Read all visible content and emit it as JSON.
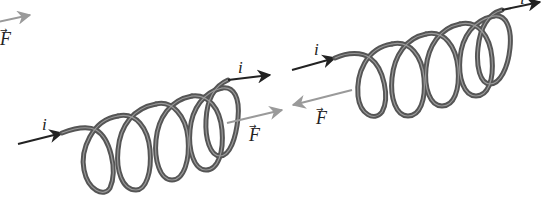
{
  "diagram": {
    "colors": {
      "coil": "#5a5a5a",
      "coil_highlight": "#9a9a9a",
      "current_arrow": "#222222",
      "force_arrow": "#9a9a9a",
      "label": "#222222"
    },
    "panels": [
      {
        "id": "partial-left",
        "force_label": "F",
        "force_vector_mark": "→"
      },
      {
        "id": "coil-force-forward",
        "current_in_label": "i",
        "current_out_label": "i",
        "force_label": "F",
        "force_vector_mark": "→",
        "turns": 5,
        "force_direction": "along current"
      },
      {
        "id": "coil-force-backward",
        "current_in_label": "i",
        "current_out_label": "i",
        "force_label": "F",
        "force_vector_mark": "→",
        "turns": 5,
        "force_direction": "opposite current"
      }
    ]
  }
}
